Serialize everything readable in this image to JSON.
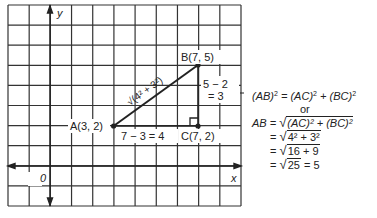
{
  "diagram": {
    "grid": {
      "cols": 11,
      "rows": 10,
      "left": 8,
      "top": 5,
      "right": 241,
      "bottom": 206
    },
    "origin_label": "0",
    "x_axis_label": "x",
    "y_axis_label": "y",
    "points": {
      "A": {
        "label": "A(3, 2)",
        "x": 3,
        "y": 2
      },
      "B": {
        "label": "B(7, 5)",
        "x": 7,
        "y": 5
      },
      "C": {
        "label": "C(7, 2)",
        "x": 7,
        "y": 2
      }
    },
    "hypotenuse_label": "√(4² + 3²)",
    "horizontal_leg_label": "7 − 3 = 4",
    "vertical_leg_label_line1": "5 − 2",
    "vertical_leg_label_line2": "= 3"
  },
  "equations": {
    "line1_lhs": "(AB)",
    "line1_mid": " = (AC)",
    "line1_mid2": " + (BC)",
    "line2": "or",
    "line3_lhs": "AB = ",
    "line3_rad": "(AC)² + (BC)²",
    "line4_rad": "4² + 3²",
    "line5_rad": "16 + 9",
    "line6_rad": "25",
    "line6_tail": " = 5",
    "equals": "= "
  }
}
